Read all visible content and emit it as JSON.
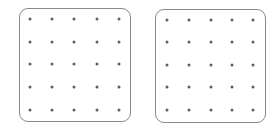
{
  "boards": [
    {
      "name": "left",
      "box": {
        "x": 19,
        "y": 8,
        "w": 112,
        "h": 114
      },
      "dot_x": [
        30,
        52,
        74,
        97,
        119
      ],
      "dot_y": [
        19,
        42,
        64,
        87,
        110
      ]
    },
    {
      "name": "right",
      "box": {
        "x": 155,
        "y": 9,
        "w": 111,
        "h": 114
      },
      "dot_x": [
        167,
        189,
        211,
        232,
        253
      ],
      "dot_y": [
        20,
        42,
        65,
        87,
        110
      ]
    }
  ],
  "grid": {
    "rows": 5,
    "cols": 5
  },
  "colors": {
    "border": "#8a8a8a",
    "dot": "#5f5f5f",
    "background": "#ffffff"
  }
}
